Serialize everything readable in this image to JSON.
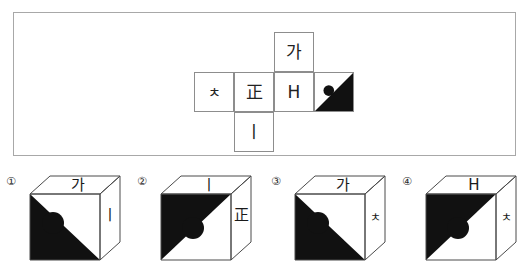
{
  "net_panel": {
    "cells": [
      {
        "id": "top",
        "label": "가",
        "type": "text"
      },
      {
        "id": "l1",
        "label": "ㅊ",
        "type": "text"
      },
      {
        "id": "l2",
        "label": "正",
        "type": "text"
      },
      {
        "id": "l3",
        "label": "H",
        "type": "text"
      },
      {
        "id": "l4",
        "label": "",
        "type": "mark",
        "mark": "black-triangle-upper-right-with-circle"
      },
      {
        "id": "bot",
        "label": "ㅣ",
        "type": "text"
      }
    ]
  },
  "options": [
    {
      "number": "①",
      "top_face": "가",
      "right_face": "ㅣ",
      "front_mark": "black-triangle-lower-left-with-circle"
    },
    {
      "number": "②",
      "top_face": "ㅣ",
      "right_face": "正",
      "front_mark": "black-triangle-upper-left-with-circle"
    },
    {
      "number": "③",
      "top_face": "가",
      "right_face": "ㅊ",
      "front_mark": "black-triangle-lower-left-with-circle"
    },
    {
      "number": "④",
      "top_face": "H",
      "right_face": "ㅊ",
      "front_mark": "black-triangle-upper-left-with-circle"
    }
  ],
  "colors": {
    "ink": "#111111",
    "line": "#8d8d8d",
    "panel_border": "#a8a8a8",
    "background": "#ffffff"
  }
}
